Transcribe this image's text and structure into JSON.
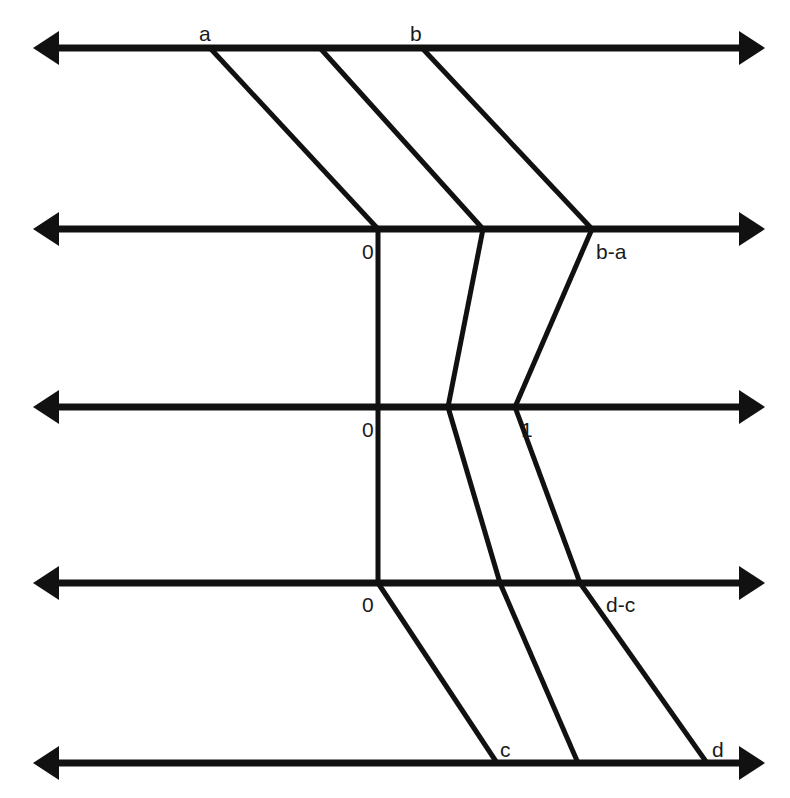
{
  "figure": {
    "type": "diagram",
    "background_color": "#ffffff",
    "line_color": "#111111",
    "label_color": "#1a1a1a",
    "width": 790,
    "height": 798
  },
  "axes": [
    {
      "id": "axis-1",
      "y": 48,
      "x_start": 33,
      "x_end": 765,
      "arrow_left": true,
      "arrow_right": true
    },
    {
      "id": "axis-2",
      "y": 229,
      "x_start": 33,
      "x_end": 765,
      "arrow_left": true,
      "arrow_right": true
    },
    {
      "id": "axis-3",
      "y": 407,
      "x_start": 33,
      "x_end": 765,
      "arrow_left": true,
      "arrow_right": true
    },
    {
      "id": "axis-4",
      "y": 583,
      "x_start": 33,
      "x_end": 765,
      "arrow_left": true,
      "arrow_right": true
    },
    {
      "id": "axis-5",
      "y": 763,
      "x_start": 33,
      "x_end": 765,
      "arrow_left": true,
      "arrow_right": true
    }
  ],
  "labels": [
    {
      "id": "label-a",
      "text": "a",
      "x": 199,
      "y": 41,
      "axis": "axis-1",
      "position": "above-left"
    },
    {
      "id": "label-b",
      "text": "b",
      "x": 410,
      "y": 41,
      "axis": "axis-1",
      "position": "above-left"
    },
    {
      "id": "label-zero-2",
      "text": "0",
      "x": 362,
      "y": 259,
      "axis": "axis-2",
      "position": "below-left"
    },
    {
      "id": "label-b-a",
      "text": "b-a",
      "x": 596,
      "y": 259,
      "axis": "axis-2",
      "position": "below-right"
    },
    {
      "id": "label-zero-3",
      "text": "0",
      "x": 362,
      "y": 437,
      "axis": "axis-3",
      "position": "below-left"
    },
    {
      "id": "label-one",
      "text": "1",
      "x": 521,
      "y": 437,
      "axis": "axis-3",
      "position": "below-right"
    },
    {
      "id": "label-zero-4",
      "text": "0",
      "x": 362,
      "y": 612,
      "axis": "axis-4",
      "position": "below-left"
    },
    {
      "id": "label-d-c",
      "text": "d-c",
      "x": 606,
      "y": 612,
      "axis": "axis-4",
      "position": "below-right"
    },
    {
      "id": "label-c",
      "text": "c",
      "x": 500,
      "y": 757,
      "axis": "axis-5",
      "position": "above-right"
    },
    {
      "id": "label-d",
      "text": "d",
      "x": 712,
      "y": 757,
      "axis": "axis-5",
      "position": "above-right"
    }
  ],
  "connectors": [
    {
      "id": "conn-a-0",
      "from_axis": "axis-1",
      "to_axis": "axis-2",
      "x1": 210,
      "y1": 48,
      "x2": 378,
      "y2": 229,
      "from_label": "a",
      "to_label": "0"
    },
    {
      "id": "conn-mid-1",
      "from_axis": "axis-1",
      "to_axis": "axis-2",
      "x1": 320,
      "y1": 48,
      "x2": 483,
      "y2": 229,
      "from_label": "",
      "to_label": ""
    },
    {
      "id": "conn-b-ba",
      "from_axis": "axis-1",
      "to_axis": "axis-2",
      "x1": 422,
      "y1": 48,
      "x2": 592,
      "y2": 229,
      "from_label": "b",
      "to_label": "b-a"
    },
    {
      "id": "conn-0-0-a",
      "from_axis": "axis-2",
      "to_axis": "axis-3",
      "x1": 378,
      "y1": 229,
      "x2": 378,
      "y2": 407,
      "from_label": "0",
      "to_label": "0"
    },
    {
      "id": "conn-mid-2",
      "from_axis": "axis-2",
      "to_axis": "axis-3",
      "x1": 483,
      "y1": 229,
      "x2": 448,
      "y2": 407,
      "from_label": "",
      "to_label": ""
    },
    {
      "id": "conn-ba-1",
      "from_axis": "axis-2",
      "to_axis": "axis-3",
      "x1": 592,
      "y1": 229,
      "x2": 515,
      "y2": 407,
      "from_label": "b-a",
      "to_label": "1"
    },
    {
      "id": "conn-0-0-b",
      "from_axis": "axis-3",
      "to_axis": "axis-4",
      "x1": 378,
      "y1": 407,
      "x2": 378,
      "y2": 583,
      "from_label": "0",
      "to_label": "0"
    },
    {
      "id": "conn-mid-3",
      "from_axis": "axis-3",
      "to_axis": "axis-4",
      "x1": 448,
      "y1": 407,
      "x2": 500,
      "y2": 583,
      "from_label": "",
      "to_label": ""
    },
    {
      "id": "conn-1-dc",
      "from_axis": "axis-3",
      "to_axis": "axis-4",
      "x1": 515,
      "y1": 407,
      "x2": 580,
      "y2": 583,
      "from_label": "1",
      "to_label": "d-c"
    },
    {
      "id": "conn-0-c",
      "from_axis": "axis-4",
      "to_axis": "axis-5",
      "x1": 378,
      "y1": 583,
      "x2": 497,
      "y2": 763,
      "from_label": "0",
      "to_label": "c"
    },
    {
      "id": "conn-mid-4",
      "from_axis": "axis-4",
      "to_axis": "axis-5",
      "x1": 500,
      "y1": 583,
      "x2": 578,
      "y2": 763,
      "from_label": "",
      "to_label": ""
    },
    {
      "id": "conn-dc-d",
      "from_axis": "axis-4",
      "to_axis": "axis-5",
      "x1": 580,
      "y1": 583,
      "x2": 707,
      "y2": 763,
      "from_label": "d-c",
      "to_label": "d"
    }
  ]
}
